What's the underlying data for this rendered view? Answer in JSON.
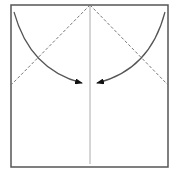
{
  "diagram": {
    "type": "origami-fold-step",
    "paper": {
      "x": 11,
      "y": 5,
      "width": 157,
      "height": 162,
      "stroke": "#555555"
    },
    "center_crease": {
      "x": 90,
      "y1": 5,
      "y2": 164,
      "stroke": "#aaaaaa"
    },
    "valley_folds": [
      {
        "from": [
          90,
          5
        ],
        "to": [
          11,
          85
        ]
      },
      {
        "from": [
          90,
          5
        ],
        "to": [
          168,
          85
        ]
      }
    ],
    "arrows": [
      {
        "name": "left-corner-arrow",
        "start": [
          14,
          12
        ],
        "control": [
          30,
          70
        ],
        "end": [
          82,
          83
        ]
      },
      {
        "name": "right-corner-arrow",
        "start": [
          165,
          12
        ],
        "control": [
          150,
          70
        ],
        "end": [
          97,
          83
        ]
      }
    ],
    "colors": {
      "line": "#555555",
      "dash": "#777777",
      "crease": "#aaaaaa",
      "arrowhead": "#111111"
    }
  }
}
